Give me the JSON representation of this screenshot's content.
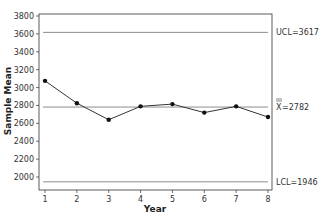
{
  "chart_data": {
    "type": "line",
    "title": "",
    "xlabel": "Year",
    "ylabel": "Sample Mean",
    "x": [
      1,
      2,
      3,
      4,
      5,
      6,
      7,
      8
    ],
    "series": [
      {
        "name": "Sample Mean",
        "values": [
          3075,
          2825,
          2640,
          2790,
          2815,
          2720,
          2790,
          2670
        ]
      }
    ],
    "ylim": [
      1900,
      3820
    ],
    "xlim": [
      0.8,
      8.2
    ],
    "yticks": [
      2000,
      2200,
      2400,
      2600,
      2800,
      3000,
      3200,
      3400,
      3600,
      3800
    ],
    "xticks": [
      1,
      2,
      3,
      4,
      5,
      6,
      7,
      8
    ],
    "reference_lines": [
      {
        "name": "UCL",
        "value": 3617,
        "label": "UCL=3617"
      },
      {
        "name": "Center",
        "value": 2782,
        "label": "X=2782"
      },
      {
        "name": "LCL",
        "value": 1946,
        "label": "LCL=1946"
      }
    ],
    "grid": false,
    "legend": "none",
    "colors": {
      "line": "#333333",
      "marker": "#111111",
      "limits": "#8c8c8c",
      "frame": "#333333"
    }
  },
  "labels": {
    "xlabel": "Year",
    "ylabel": "Sample Mean",
    "ucl": "UCL=3617",
    "center_prefix": "X",
    "center_value": "=2782",
    "lcl": "LCL=1946"
  }
}
